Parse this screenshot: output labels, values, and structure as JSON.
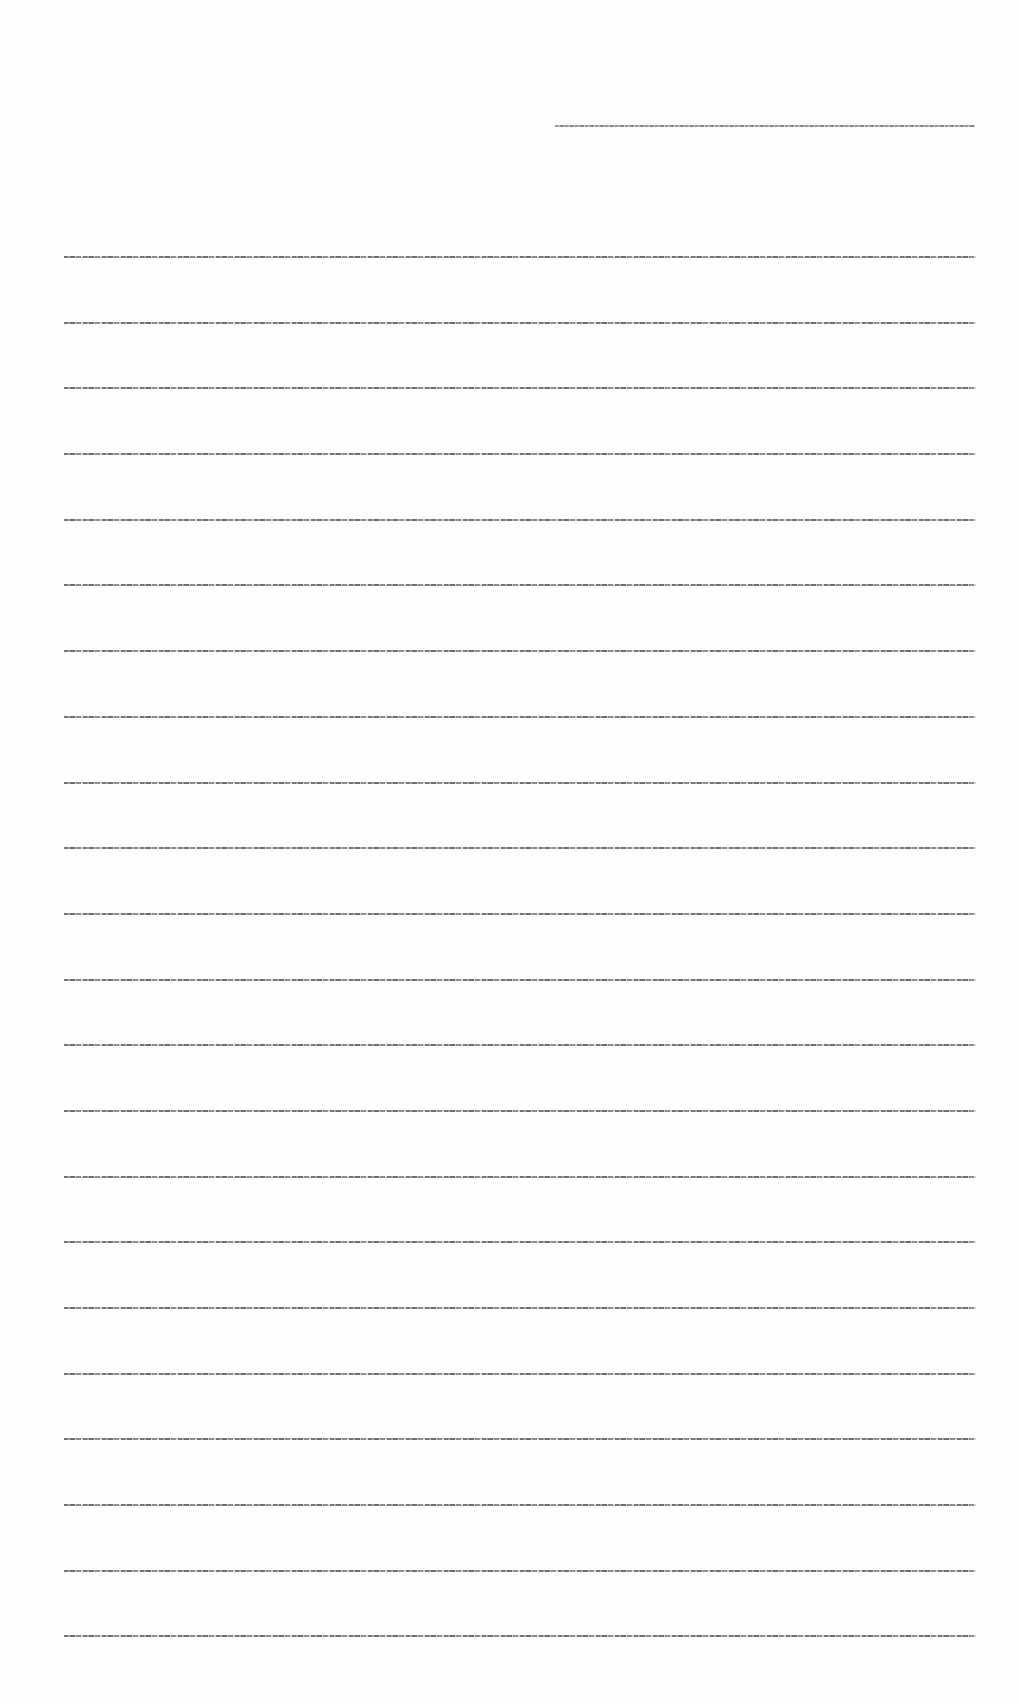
{
  "document": {
    "header": {
      "text": ""
    },
    "body": {
      "line_count": 22,
      "lines": [
        {
          "text": ""
        },
        {
          "text": ""
        },
        {
          "text": ""
        },
        {
          "text": ""
        },
        {
          "text": ""
        },
        {
          "text": ""
        },
        {
          "text": ""
        },
        {
          "text": ""
        },
        {
          "text": ""
        },
        {
          "text": ""
        },
        {
          "text": ""
        },
        {
          "text": ""
        },
        {
          "text": ""
        },
        {
          "text": ""
        },
        {
          "text": ""
        },
        {
          "text": ""
        },
        {
          "text": ""
        },
        {
          "text": ""
        },
        {
          "text": ""
        },
        {
          "text": ""
        },
        {
          "text": ""
        },
        {
          "text": ""
        }
      ]
    }
  },
  "colors": {
    "background": "#fefefe",
    "text": "#777777"
  }
}
